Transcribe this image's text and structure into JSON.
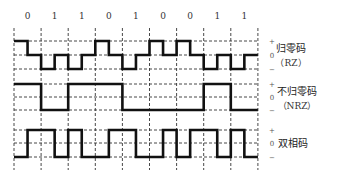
{
  "bits": [
    "0",
    "1",
    "1",
    "0",
    "1",
    "0",
    "0",
    "1",
    "1"
  ],
  "level_labels": {
    "plus": "+",
    "zero": "0",
    "minus": "−"
  },
  "rows": [
    {
      "id": "rz",
      "label": "归零码",
      "sublabel": "（RZ）"
    },
    {
      "id": "nrz",
      "label": "不归零码",
      "sublabel": "（NRZ）"
    },
    {
      "id": "biphase",
      "label": "双相码",
      "sublabel": ""
    }
  ],
  "layout": {
    "x0": 14,
    "bit_width": 27.1,
    "bit_label_y": 19,
    "rows": [
      {
        "plus": 41,
        "zero": 55,
        "minus": 69
      },
      {
        "plus": 84,
        "zero": 97,
        "minus": 110
      },
      {
        "plus": 130,
        "zero": 143,
        "minus": 157
      }
    ],
    "grid_top": 28,
    "grid_bottom": 170
  },
  "waveforms": {
    "rz": [
      [
        "+",
        "0"
      ],
      [
        "-",
        "0"
      ],
      [
        "-",
        "0"
      ],
      [
        "+",
        "0"
      ],
      [
        "-",
        "0"
      ],
      [
        "+",
        "0"
      ],
      [
        "+",
        "0"
      ],
      [
        "-",
        "0"
      ],
      [
        "-",
        "0"
      ]
    ],
    "nrz": [
      [
        "+",
        "+"
      ],
      [
        "-",
        "-"
      ],
      [
        "+",
        "+"
      ],
      [
        "+",
        "+"
      ],
      [
        "-",
        "-"
      ],
      [
        "-",
        "-"
      ],
      [
        "-",
        "-"
      ],
      [
        "+",
        "+"
      ],
      [
        "-",
        "-"
      ]
    ],
    "biphase": [
      [
        "-",
        "+"
      ],
      [
        "+",
        "-"
      ],
      [
        "+",
        "-"
      ],
      [
        "-",
        "+"
      ],
      [
        "+",
        "-"
      ],
      [
        "-",
        "+"
      ],
      [
        "-",
        "+"
      ],
      [
        "+",
        "-"
      ],
      [
        "+",
        "-"
      ]
    ]
  },
  "colors": {
    "line": "#111111",
    "grid": "#333333",
    "text": "#222222",
    "background": "#ffffff"
  }
}
